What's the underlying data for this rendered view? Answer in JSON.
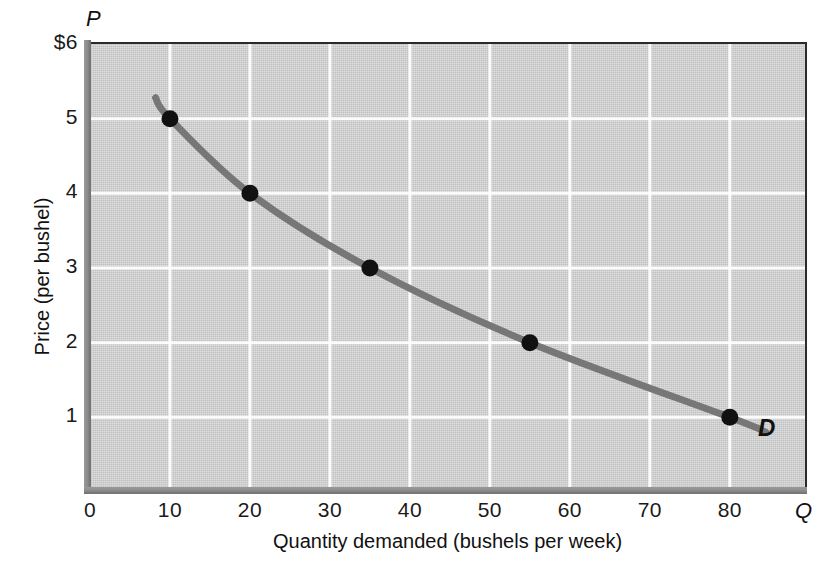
{
  "chart_data": {
    "type": "line",
    "title": "",
    "subtitle": "",
    "xlabel": "Quantity demanded (bushels per week)",
    "ylabel": "Price (per bushel)",
    "x_symbol": "Q",
    "y_symbol": "P",
    "xlim": [
      0,
      89.4
    ],
    "ylim": [
      0,
      6
    ],
    "xticks": [
      0,
      10,
      20,
      30,
      40,
      50,
      60,
      70,
      80
    ],
    "xtick_labels": [
      "0",
      "10",
      "20",
      "30",
      "40",
      "50",
      "60",
      "70",
      "80"
    ],
    "yticks": [
      1,
      2,
      3,
      4,
      5,
      6
    ],
    "ytick_labels": [
      "1",
      "2",
      "3",
      "4",
      "5",
      "$6"
    ],
    "grid": true,
    "grid_color": "#ffffff",
    "plot_bgcolor": "#cbcbcb",
    "legend": "none",
    "series": [
      {
        "name": "D",
        "label": "D",
        "color": "#777777",
        "marker_color": "#111111",
        "x": [
          10,
          20,
          35,
          55,
          80
        ],
        "y": [
          5,
          4,
          3,
          2,
          1
        ],
        "points": [
          {
            "q": 10,
            "p": 5
          },
          {
            "q": 20,
            "p": 4
          },
          {
            "q": 35,
            "p": 3
          },
          {
            "q": 55,
            "p": 2
          },
          {
            "q": 80,
            "p": 1
          }
        ]
      }
    ],
    "annotations": [
      {
        "text": "D",
        "q": 84,
        "p": 0.75
      }
    ]
  },
  "axes": {
    "y_ticks": [
      {
        "label": "$6",
        "value": 6
      },
      {
        "label": "5",
        "value": 5
      },
      {
        "label": "4",
        "value": 4
      },
      {
        "label": "3",
        "value": 3
      },
      {
        "label": "2",
        "value": 2
      },
      {
        "label": "1",
        "value": 1
      }
    ],
    "x_ticks": [
      {
        "label": "0",
        "value": 0
      },
      {
        "label": "10",
        "value": 10
      },
      {
        "label": "20",
        "value": 20
      },
      {
        "label": "30",
        "value": 30
      },
      {
        "label": "40",
        "value": 40
      },
      {
        "label": "50",
        "value": 50
      },
      {
        "label": "60",
        "value": 60
      },
      {
        "label": "70",
        "value": 70
      },
      {
        "label": "80",
        "value": 80
      }
    ],
    "x_title": "Quantity demanded (bushels per week)",
    "y_title": "Price (per bushel)",
    "x_symbol": "Q",
    "y_symbol": "P"
  },
  "curve": {
    "label": "D",
    "color": "#777777",
    "point_color": "#111111"
  }
}
